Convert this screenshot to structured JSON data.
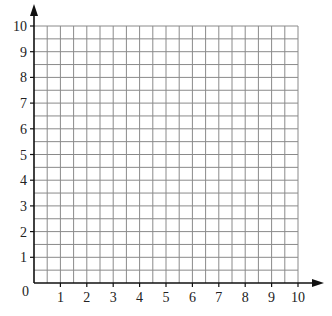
{
  "chart_data": {
    "type": "grid",
    "title": "",
    "xlabel": "",
    "ylabel": "",
    "xlim": [
      0,
      10
    ],
    "ylim": [
      0,
      10
    ],
    "x_ticks": [
      1,
      2,
      3,
      4,
      5,
      6,
      7,
      8,
      9,
      10
    ],
    "y_ticks": [
      1,
      2,
      3,
      4,
      5,
      6,
      7,
      8,
      9,
      10
    ],
    "origin_label": "0",
    "grid": true,
    "minor_grid_step": 0.5,
    "major_grid_step": 1,
    "series": [],
    "axis_arrows": true
  },
  "colors": {
    "axis": "#111111",
    "grid": "#8a8a8a",
    "label": "#222222"
  },
  "layout": {
    "origin_px": [
      34,
      283
    ],
    "x_end_px": 298,
    "y_end_px": 26
  }
}
